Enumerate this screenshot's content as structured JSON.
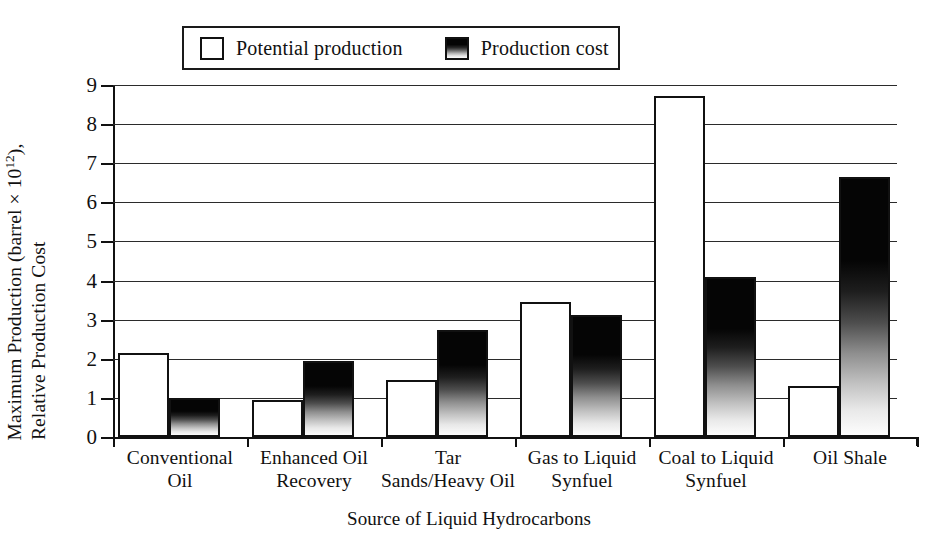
{
  "figure": {
    "background": "#ffffff",
    "ink_color": "#111111"
  },
  "legend": {
    "position": "top-center",
    "entries": [
      {
        "label": "Potential production",
        "swatch": "hollow-square-icon",
        "fill": "#ffffff"
      },
      {
        "label": "Production cost",
        "swatch": "gradient-square-icon",
        "fill": "#050505"
      }
    ]
  },
  "axes": {
    "ylabel_line1": "Maximum Production (barrel × 10",
    "ylabel_exponent": "12",
    "ylabel_line1_tail": "),",
    "ylabel_line2": "Relative Production Cost",
    "xlabel": "Source of Liquid Hydrocarbons",
    "yticks": [
      "0",
      "1",
      "2",
      "3",
      "4",
      "5",
      "6",
      "7",
      "8",
      "9"
    ]
  },
  "chart_data": {
    "type": "bar",
    "title": "",
    "xlabel": "Source of Liquid Hydrocarbons",
    "ylabel": "Maximum Production (barrel × 10^12), Relative Production Cost",
    "ylim": [
      0,
      9
    ],
    "yticks": [
      0,
      1,
      2,
      3,
      4,
      5,
      6,
      7,
      8,
      9
    ],
    "grid": true,
    "legend_position": "top-center",
    "categories": [
      "Conventional Oil",
      "Enhanced Oil Recovery",
      "Tar Sands/Heavy Oil",
      "Gas to Liquid Synfuel",
      "Coal to Liquid Synfuel",
      "Oil Shale"
    ],
    "category_lines": [
      [
        "Conventional",
        "Oil"
      ],
      [
        "Enhanced Oil",
        "Recovery"
      ],
      [
        "Tar",
        "Sands/Heavy Oil"
      ],
      [
        "Gas to Liquid",
        "Synfuel"
      ],
      [
        "Coal to Liquid",
        "Synfuel"
      ],
      [
        "Oil Shale",
        ""
      ]
    ],
    "series": [
      {
        "name": "Potential production",
        "values": [
          2.15,
          0.95,
          1.45,
          3.45,
          8.72,
          1.3
        ]
      },
      {
        "name": "Production cost",
        "values": [
          1.0,
          1.95,
          2.73,
          3.12,
          4.1,
          6.65
        ]
      }
    ]
  }
}
